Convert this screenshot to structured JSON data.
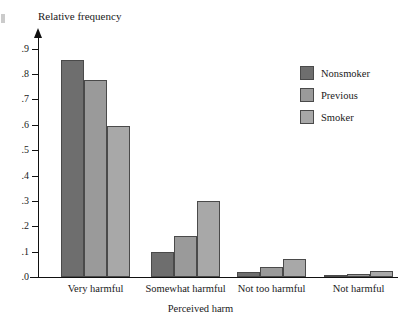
{
  "chart_data": {
    "type": "bar",
    "title": "",
    "xlabel": "Perceived harm",
    "ylabel": "Relative frequency",
    "categories": [
      "Very harmful",
      "Somewhat harmful",
      "Not too harmful",
      "Not harmful"
    ],
    "series": [
      {
        "name": "Nonsmoker",
        "color": "#6e6e6e",
        "values": [
          0.855,
          0.1,
          0.02,
          0.005
        ]
      },
      {
        "name": "Previous",
        "color": "#9a9a9a",
        "values": [
          0.775,
          0.16,
          0.04,
          0.012
        ]
      },
      {
        "name": "Smoker",
        "color": "#a8a8a8",
        "values": [
          0.595,
          0.3,
          0.07,
          0.022
        ]
      }
    ],
    "ylim": [
      0,
      0.95
    ],
    "yticks": [
      ".0",
      ".1",
      ".2",
      ".3",
      ".4",
      ".5",
      ".6",
      ".7",
      ".8",
      ".9"
    ],
    "ytick_values": [
      0,
      0.1,
      0.2,
      0.3,
      0.4,
      0.5,
      0.6,
      0.7,
      0.8,
      0.9
    ],
    "grid": false,
    "legend_position": "right-top",
    "axis_color": "#111111"
  }
}
